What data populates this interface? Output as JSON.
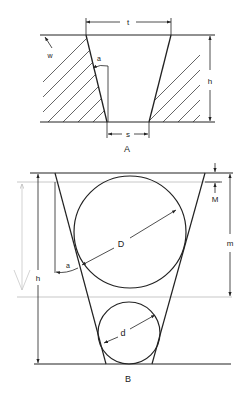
{
  "diagram_a": {
    "caption": "A",
    "labels": {
      "t": "t",
      "h": "h",
      "s": "s",
      "a": "a",
      "w": "w"
    }
  },
  "diagram_b": {
    "caption": "B",
    "labels": {
      "D": "D",
      "d": "d",
      "h": "h",
      "m": "m",
      "M": "M",
      "a": "a"
    }
  },
  "colors": {
    "line": "#222222",
    "guide": "#c8c8c8",
    "background": "#ffffff"
  }
}
